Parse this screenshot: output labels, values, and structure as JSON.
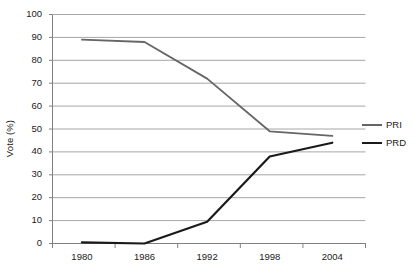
{
  "chart_data": {
    "type": "line",
    "title": "",
    "xlabel": "",
    "ylabel": "Vote (%)",
    "x": [
      1980,
      1986,
      1992,
      1998,
      2004
    ],
    "categories": [
      "1980",
      "1986",
      "1992",
      "1998",
      "2004"
    ],
    "series": [
      {
        "name": "PRI",
        "color": "#666666",
        "values": [
          89,
          88,
          72,
          49,
          47
        ]
      },
      {
        "name": "PRD",
        "color": "#1a1a1a",
        "values": [
          0.5,
          0,
          9.5,
          38,
          44
        ]
      }
    ],
    "ylim": [
      0,
      100
    ],
    "ytick_values": [
      0,
      10,
      20,
      30,
      40,
      50,
      60,
      70,
      80,
      90,
      100
    ],
    "ytick_labels": [
      "0",
      "10",
      "20",
      "30",
      "40",
      "50",
      "60",
      "70",
      "80",
      "90",
      "100"
    ],
    "grid": true,
    "grid_color": "#a6a6a6",
    "axis_color": "#808080",
    "legend_position": "right"
  },
  "axis": {
    "y_title": "Vote (%)"
  },
  "legend": {
    "entries": [
      {
        "label": "PRI"
      },
      {
        "label": "PRD"
      }
    ]
  }
}
